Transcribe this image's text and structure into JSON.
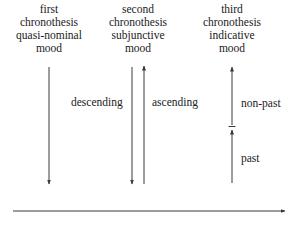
{
  "columns": [
    {
      "id": "first",
      "heading": [
        "first",
        "chronothesis",
        "quasi-nominal",
        "mood"
      ]
    },
    {
      "id": "second",
      "heading": [
        "second",
        "chronothesis",
        "subjunctive",
        "mood"
      ]
    },
    {
      "id": "third",
      "heading": [
        "third",
        "chronothesis",
        "indicative",
        "mood"
      ]
    }
  ],
  "labels": {
    "descending": "descending",
    "ascending": "ascending",
    "non_past": "non-past",
    "past": "past"
  },
  "colors": {
    "line": "#3a3a3a",
    "text": "#1a1a1a"
  }
}
